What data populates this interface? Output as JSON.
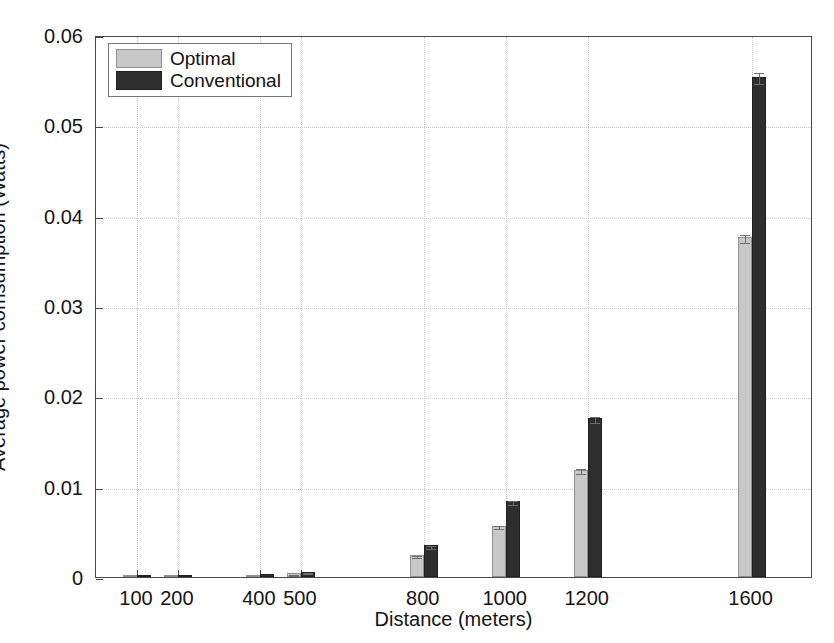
{
  "page": {
    "header_ghost": ""
  },
  "chart_data": {
    "type": "bar",
    "title": "",
    "xlabel": "Distance (meters)",
    "ylabel": "Average power comsumption (Watts)",
    "categories": [
      "100",
      "200",
      "400",
      "500",
      "800",
      "1000",
      "1200",
      "1600"
    ],
    "category_positions": [
      100,
      200,
      400,
      500,
      800,
      1000,
      1200,
      1600
    ],
    "xlim": [
      0,
      1750
    ],
    "ylim": [
      0,
      0.06
    ],
    "ytick_labels": [
      "0",
      "0.01",
      "0.02",
      "0.03",
      "0.04",
      "0.05",
      "0.06"
    ],
    "ytick_values": [
      0,
      0.01,
      0.02,
      0.03,
      0.04,
      0.05,
      0.06
    ],
    "xtick_labels": [
      "100",
      "200",
      "400",
      "500",
      "800",
      "1000",
      "1200",
      "1600"
    ],
    "grid": true,
    "grid_style": "dotted",
    "legend_position": "upper-left",
    "series": [
      {
        "name": "Optimal",
        "color": "#c8c8c8",
        "values": [
          2e-05,
          4e-05,
          0.0002,
          0.0004,
          0.0024,
          0.0057,
          0.0119,
          0.0376
        ],
        "errors": [
          0.0,
          0.0,
          2e-05,
          3e-05,
          0.00012,
          0.0002,
          0.0003,
          0.00045
        ]
      },
      {
        "name": "Conventional",
        "color": "#2e2e2e",
        "values": [
          3e-05,
          6e-05,
          0.0003,
          0.0006,
          0.0035,
          0.0084,
          0.0176,
          0.0554
        ],
        "errors": [
          0.0,
          0.0,
          2e-05,
          3e-05,
          0.00015,
          0.00022,
          0.00035,
          0.0006
        ]
      }
    ],
    "colors": {
      "optimal": "#c8c8c8",
      "conventional": "#2e2e2e",
      "axis": "#4a4a4a",
      "grid": "#c9c9c9",
      "background": "#ffffff"
    }
  }
}
